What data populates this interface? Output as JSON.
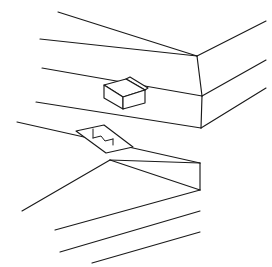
{
  "figure": {
    "style": "technical patent line art, black strokes on white",
    "background_color": "#ffffff",
    "stroke_color": "#1a1a1a",
    "stroke_width": 1.15,
    "canvas": {
      "width": 272,
      "height": 267
    },
    "caption": "",
    "parts": [
      {
        "id": "upper-board",
        "name": "upper board",
        "description": "Upper board shown in perspective with a mitred corner, top face, front bevel face and lower edge face; carries a raised rectangular key block on its top face.",
        "corner_vertex": {
          "x": 197,
          "y": 56
        }
      },
      {
        "id": "lower-board",
        "name": "lower board",
        "description": "Lower board shown in perspective with a mitred corner, top face and front edge face; carries a recessed slot (mortise) on its top face.",
        "corner_vertex": {
          "x": 200,
          "y": 163
        }
      },
      {
        "id": "tenon-key",
        "name": "raised rectangular key block (tenon)",
        "description": "Small rectangular block standing proud of the upper board top face.",
        "center": {
          "x": 122,
          "y": 93
        }
      },
      {
        "id": "mortise-slot",
        "name": "recessed slot (mortise)",
        "description": "Elongated rectangular recess sunk into the lower board top face, with an internal step.",
        "center": {
          "x": 98,
          "y": 139
        }
      }
    ],
    "geometry": {
      "upper_board": {
        "top_back_edge": [
          [
            58,
            12
          ],
          [
            197,
            56
          ]
        ],
        "top_back_right_edge": [
          [
            197,
            56
          ],
          [
            266,
            21
          ]
        ],
        "top_front_edge": [
          [
            40,
            39
          ],
          [
            197,
            56
          ]
        ],
        "bevel_right_edge": [
          [
            197,
            56
          ],
          [
            202,
            96
          ]
        ],
        "bevel_front_edge": [
          [
            42,
            68
          ],
          [
            202,
            96
          ]
        ],
        "bevel_right_upper": [
          [
            202,
            96
          ],
          [
            266,
            60
          ]
        ],
        "lower_edge_front": [
          [
            36,
            102
          ],
          [
            201,
            128
          ]
        ],
        "vertical_right": [
          [
            202,
            96
          ],
          [
            201,
            128
          ]
        ],
        "lower_right_edge": [
          [
            201,
            128
          ],
          [
            266,
            88
          ]
        ]
      },
      "lower_board": {
        "top_back_edge": [
          [
            17,
            122
          ],
          [
            200,
            163
          ]
        ],
        "top_front_left_edge": [
          [
            110,
            160
          ],
          [
            200,
            163
          ]
        ],
        "corner_fold_edge": [
          [
            110,
            160
          ],
          [
            200,
            163
          ]
        ],
        "front_left_edge": [
          [
            52,
            225
          ],
          [
            110,
            160
          ]
        ],
        "front_face_edge": [
          [
            110,
            160
          ],
          [
            200,
            190
          ]
        ],
        "vertical_right": [
          [
            200,
            163
          ],
          [
            200,
            190
          ]
        ],
        "bottom_left_edge": [
          [
            57,
            251
          ],
          [
            200,
            190
          ]
        ],
        "bottom_line_a": [
          [
            88,
            240
          ],
          [
            200,
            190
          ]
        ],
        "bottom_line_b": [
          [
            118,
            262
          ],
          [
            200,
            212
          ]
        ]
      },
      "tenon_key": {
        "top_face": [
          [
            104,
            85
          ],
          [
            126,
            79
          ],
          [
            145,
            90
          ],
          [
            123,
            97
          ]
        ],
        "front_face": [
          [
            104,
            85
          ],
          [
            104,
            98
          ],
          [
            123,
            109
          ],
          [
            123,
            97
          ]
        ],
        "right_face": [
          [
            123,
            97
          ],
          [
            123,
            109
          ],
          [
            145,
            103
          ],
          [
            145,
            90
          ]
        ],
        "tab": [
          [
            126,
            79
          ],
          [
            130,
            77
          ],
          [
            148,
            88
          ],
          [
            145,
            90
          ]
        ]
      },
      "mortise_slot": {
        "outline": [
          [
            76,
            131
          ],
          [
            104,
            125
          ],
          [
            133,
            147
          ],
          [
            106,
            153
          ]
        ],
        "inner_step": [
          [
            96,
            140
          ],
          [
            104,
            138
          ],
          [
            108,
            143
          ],
          [
            100,
            145
          ]
        ]
      }
    }
  },
  "labels": {
    "figure_label": "",
    "reference_numerals": []
  }
}
